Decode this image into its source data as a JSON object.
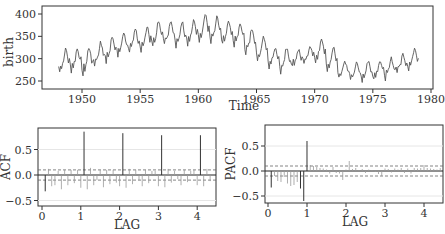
{
  "chart_data": [
    {
      "type": "line",
      "title": "",
      "xlabel": "Time",
      "ylabel": "birth",
      "xlim": [
        1947,
        1980
      ],
      "ylim": [
        240,
        405
      ],
      "xticks": [
        1950,
        1955,
        1960,
        1965,
        1970,
        1975,
        1980
      ],
      "yticks": [
        250,
        300,
        350,
        400
      ],
      "grid": false,
      "series": [
        {
          "name": "birth",
          "start": 1948.0,
          "frequency": 12,
          "annual_peaks": [
            {
              "year": 1948,
              "peak": 320,
              "trough": 270
            },
            {
              "year": 1949,
              "peak": 322,
              "trough": 272
            },
            {
              "year": 1950,
              "peak": 325,
              "trough": 262
            },
            {
              "year": 1951,
              "peak": 335,
              "trough": 285
            },
            {
              "year": 1952,
              "peak": 352,
              "trough": 290
            },
            {
              "year": 1953,
              "peak": 358,
              "trough": 305
            },
            {
              "year": 1954,
              "peak": 365,
              "trough": 312
            },
            {
              "year": 1955,
              "peak": 372,
              "trough": 315
            },
            {
              "year": 1956,
              "peak": 385,
              "trough": 325
            },
            {
              "year": 1957,
              "peak": 385,
              "trough": 330
            },
            {
              "year": 1958,
              "peak": 382,
              "trough": 328
            },
            {
              "year": 1959,
              "peak": 385,
              "trough": 332
            },
            {
              "year": 1960,
              "peak": 403,
              "trough": 335
            },
            {
              "year": 1961,
              "peak": 392,
              "trough": 335
            },
            {
              "year": 1962,
              "peak": 380,
              "trough": 330
            },
            {
              "year": 1963,
              "peak": 375,
              "trough": 330
            },
            {
              "year": 1964,
              "peak": 368,
              "trough": 310
            },
            {
              "year": 1965,
              "peak": 348,
              "trough": 295
            },
            {
              "year": 1966,
              "peak": 325,
              "trough": 280
            },
            {
              "year": 1967,
              "peak": 325,
              "trough": 270
            },
            {
              "year": 1968,
              "peak": 320,
              "trough": 282
            },
            {
              "year": 1969,
              "peak": 330,
              "trough": 285
            },
            {
              "year": 1970,
              "peak": 342,
              "trough": 292
            },
            {
              "year": 1971,
              "peak": 325,
              "trough": 270
            },
            {
              "year": 1972,
              "peak": 290,
              "trough": 260
            },
            {
              "year": 1973,
              "peak": 288,
              "trough": 255
            },
            {
              "year": 1974,
              "peak": 295,
              "trough": 250
            },
            {
              "year": 1975,
              "peak": 295,
              "trough": 255
            },
            {
              "year": 1976,
              "peak": 300,
              "trough": 255
            },
            {
              "year": 1977,
              "peak": 310,
              "trough": 270
            },
            {
              "year": 1978,
              "peak": 325,
              "trough": 275
            }
          ]
        }
      ]
    },
    {
      "type": "bar",
      "subtype": "acf",
      "title": "",
      "xlabel": "LAG",
      "ylabel": "ACF",
      "xlim": [
        -0.05,
        4.35
      ],
      "ylim": [
        -0.62,
        0.95
      ],
      "xticks": [
        0,
        1,
        2,
        3,
        4
      ],
      "yticks": [
        -0.5,
        0.0,
        0.5
      ],
      "confidence_band": [
        -0.1,
        0.1
      ],
      "lag_step": 0.08333,
      "values": [
        -0.32,
        0.12,
        -0.22,
        -0.2,
        0.08,
        -0.28,
        0.1,
        -0.2,
        0.1,
        -0.16,
        0.1,
        -0.25,
        0.85,
        -0.28,
        0.14,
        -0.2,
        -0.1,
        0.1,
        -0.24,
        0.1,
        -0.18,
        0.1,
        -0.15,
        -0.22,
        0.82,
        -0.25,
        0.12,
        -0.18,
        0.1,
        -0.1,
        -0.22,
        0.1,
        -0.16,
        0.08,
        0.08,
        -0.22,
        0.78,
        -0.24,
        0.12,
        -0.15,
        0.08,
        -0.08,
        -0.2,
        0.1,
        -0.14,
        0.08,
        0.1,
        -0.2,
        0.78,
        -0.22,
        0.12,
        -0.12
      ]
    },
    {
      "type": "bar",
      "subtype": "pacf",
      "title": "",
      "xlabel": "LAG",
      "ylabel": "PACF",
      "xlim": [
        -0.05,
        4.4
      ],
      "ylim": [
        -0.65,
        0.92
      ],
      "xticks": [
        0,
        1,
        2,
        3,
        4
      ],
      "yticks": [
        -0.5,
        0.0,
        0.5
      ],
      "confidence_band": [
        -0.1,
        0.1
      ],
      "lag_step": 0.08333,
      "values": [
        -0.33,
        -0.1,
        -0.2,
        -0.22,
        -0.12,
        -0.25,
        -0.3,
        -0.28,
        -0.22,
        -0.35,
        -0.6,
        0.6,
        0.12,
        0.1,
        0.08,
        0.06,
        0.05,
        0.03,
        -0.05,
        0.08,
        -0.04,
        -0.05,
        -0.18,
        0.03,
        0.2,
        0.04,
        0.06,
        0.02,
        0.04,
        -0.04,
        0.03,
        0.02,
        -0.02,
        -0.06,
        -0.1,
        0.05,
        0.04,
        -0.03,
        0.05,
        0.03,
        0.06,
        -0.04,
        0.05,
        -0.05,
        0.06,
        0.05,
        0.06,
        0.12,
        0.06,
        0.05,
        0.04,
        0.03,
        0.06
      ]
    }
  ],
  "panels": {
    "top": {
      "ylabel": "birth",
      "xlabel": "Time",
      "xtick_labels": [
        "1950",
        "1955",
        "1960",
        "1965",
        "1970",
        "1975",
        "1980"
      ],
      "ytick_labels": [
        "250",
        "300",
        "350",
        "400"
      ]
    },
    "acf": {
      "ylabel": "ACF",
      "xlabel": "LAG",
      "xtick_labels": [
        "0",
        "1",
        "2",
        "3",
        "4"
      ],
      "ytick_labels": [
        "0.5",
        "0.0",
        "−0.5"
      ]
    },
    "pacf": {
      "ylabel": "PACF",
      "xlabel": "LAG",
      "xtick_labels": [
        "0",
        "1",
        "2",
        "3",
        "4"
      ],
      "ytick_labels": [
        "0.5",
        "0.0",
        "−0.5"
      ]
    }
  },
  "colors": {
    "line": "#555555",
    "axis": "#333333",
    "grid": "#e6e6e6",
    "band": "#666666",
    "zero": "#222222"
  }
}
